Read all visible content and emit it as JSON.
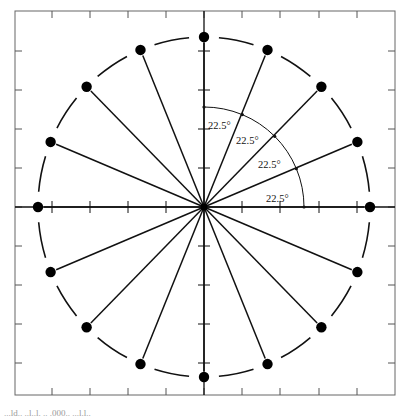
{
  "diagram": {
    "type": "polar-spoke-diagram",
    "center": {
      "x": 204,
      "y": 207
    },
    "radius_x": 166,
    "radius_y": 170,
    "num_points": 16,
    "angle_step_deg": 22.5,
    "frame": {
      "left": 15,
      "top": 11,
      "right": 395,
      "bottom": 395
    },
    "x_ticks": [
      52,
      90,
      128,
      166,
      204,
      242,
      280,
      319,
      357
    ],
    "y_ticks": [
      51,
      90,
      129,
      168,
      207,
      246,
      285,
      324,
      363
    ],
    "angle_labels": [
      {
        "text": "22.5°",
        "x": 208,
        "y": 129
      },
      {
        "text": "22.5°",
        "x": 236,
        "y": 144
      },
      {
        "text": "22.5°",
        "x": 258,
        "y": 168
      },
      {
        "text": "22.5°",
        "x": 266,
        "y": 202
      }
    ],
    "colors": {
      "line": "#111111",
      "frame": "#555555",
      "dot": "#000000"
    }
  },
  "caption": "...ld.. ..l..l. .. .000.. ...l.l.."
}
